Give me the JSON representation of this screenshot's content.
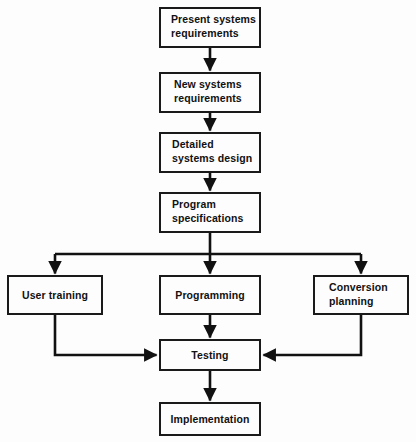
{
  "diagram": {
    "background_color": "#fdfdfd",
    "line_color": "#111111",
    "box_fill": "#fdfdfd",
    "nodes": [
      {
        "id": "present",
        "label_line1": "Present systems",
        "label_line2": "requirements"
      },
      {
        "id": "new",
        "label_line1": "New systems",
        "label_line2": "requirements"
      },
      {
        "id": "detailed",
        "label_line1": "Detailed",
        "label_line2": "systems design"
      },
      {
        "id": "program_spec",
        "label_line1": "Program",
        "label_line2": "specifications"
      },
      {
        "id": "user_training",
        "label_line1": "User training",
        "label_line2": ""
      },
      {
        "id": "programming",
        "label_line1": "Programming",
        "label_line2": ""
      },
      {
        "id": "conversion",
        "label_line1": "Conversion",
        "label_line2": "planning"
      },
      {
        "id": "testing",
        "label_line1": "Testing",
        "label_line2": ""
      },
      {
        "id": "implementation",
        "label_line1": "Implementation",
        "label_line2": ""
      }
    ]
  }
}
